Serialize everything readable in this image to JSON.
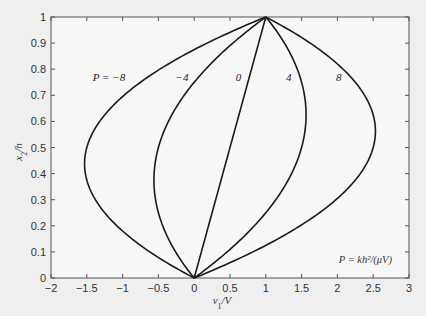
{
  "chart_data": {
    "type": "line",
    "title": "",
    "xlabel": "v1/V",
    "ylabel": "x2/h",
    "xlim": [
      -2,
      3
    ],
    "ylim": [
      0,
      1
    ],
    "xticks": [
      -2,
      -1.5,
      -1,
      -0.5,
      0,
      0.5,
      1,
      1.5,
      2,
      2.5,
      3
    ],
    "xtick_labels": [
      "−2",
      "−1.5",
      "−1",
      "−0.5",
      "0",
      "0.5",
      "1",
      "1.5",
      "2",
      "2.5",
      "3"
    ],
    "yticks": [
      0,
      0.1,
      0.2,
      0.3,
      0.4,
      0.5,
      0.6,
      0.7,
      0.8,
      0.9,
      1
    ],
    "ytick_labels": [
      "0",
      "0.1",
      "0.2",
      "0.3",
      "0.4",
      "0.5",
      "0.6",
      "0.7",
      "0.8",
      "0.9",
      "1"
    ],
    "grid": false,
    "legend": null,
    "annotation": "P = kh²/(μV)",
    "model": "v1/V = x2/h + P (x2/h)(1 - x2/h)",
    "series": [
      {
        "name": "P = -8",
        "label": "P = −8",
        "P": -8,
        "points": [
          [
            0,
            0
          ],
          [
            -0.62,
            0.1
          ],
          [
            -1.08,
            0.2
          ],
          [
            -1.38,
            0.3
          ],
          [
            -1.52,
            0.4
          ],
          [
            -1.5,
            0.5
          ],
          [
            -1.32,
            0.6
          ],
          [
            -0.98,
            0.7
          ],
          [
            -0.48,
            0.8
          ],
          [
            0.18,
            0.9
          ],
          [
            1,
            1
          ]
        ]
      },
      {
        "name": "P = -4",
        "label": "−4",
        "P": -4,
        "points": [
          [
            0,
            0
          ],
          [
            -0.26,
            0.1
          ],
          [
            -0.44,
            0.2
          ],
          [
            -0.54,
            0.3
          ],
          [
            -0.56,
            0.4
          ],
          [
            -0.5,
            0.5
          ],
          [
            -0.36,
            0.6
          ],
          [
            -0.14,
            0.7
          ],
          [
            0.16,
            0.8
          ],
          [
            0.54,
            0.9
          ],
          [
            1,
            1
          ]
        ]
      },
      {
        "name": "P = 0",
        "label": "0",
        "P": 0,
        "points": [
          [
            0,
            0
          ],
          [
            0.1,
            0.1
          ],
          [
            0.2,
            0.2
          ],
          [
            0.3,
            0.3
          ],
          [
            0.4,
            0.4
          ],
          [
            0.5,
            0.5
          ],
          [
            0.6,
            0.6
          ],
          [
            0.7,
            0.7
          ],
          [
            0.8,
            0.8
          ],
          [
            0.9,
            0.9
          ],
          [
            1,
            1
          ]
        ]
      },
      {
        "name": "P = 4",
        "label": "4",
        "P": 4,
        "points": [
          [
            0,
            0
          ],
          [
            0.46,
            0.1
          ],
          [
            0.84,
            0.2
          ],
          [
            1.14,
            0.3
          ],
          [
            1.36,
            0.4
          ],
          [
            1.5,
            0.5
          ],
          [
            1.56,
            0.6
          ],
          [
            1.54,
            0.7
          ],
          [
            1.44,
            0.8
          ],
          [
            1.26,
            0.9
          ],
          [
            1,
            1
          ]
        ]
      },
      {
        "name": "P = 8",
        "label": "8",
        "P": 8,
        "points": [
          [
            0,
            0
          ],
          [
            0.82,
            0.1
          ],
          [
            1.48,
            0.2
          ],
          [
            1.98,
            0.3
          ],
          [
            2.32,
            0.4
          ],
          [
            2.5,
            0.5
          ],
          [
            2.52,
            0.6
          ],
          [
            2.38,
            0.7
          ],
          [
            2.08,
            0.8
          ],
          [
            1.62,
            0.9
          ],
          [
            1,
            1
          ]
        ]
      }
    ],
    "label_positions": [
      {
        "text": "P = −8",
        "x": -1.19,
        "y": 0.77
      },
      {
        "text": "−4",
        "x": -0.17,
        "y": 0.77
      },
      {
        "text": "0",
        "x": 0.62,
        "y": 0.77
      },
      {
        "text": "4",
        "x": 1.32,
        "y": 0.77
      },
      {
        "text": "8",
        "x": 2.02,
        "y": 0.77
      }
    ]
  }
}
